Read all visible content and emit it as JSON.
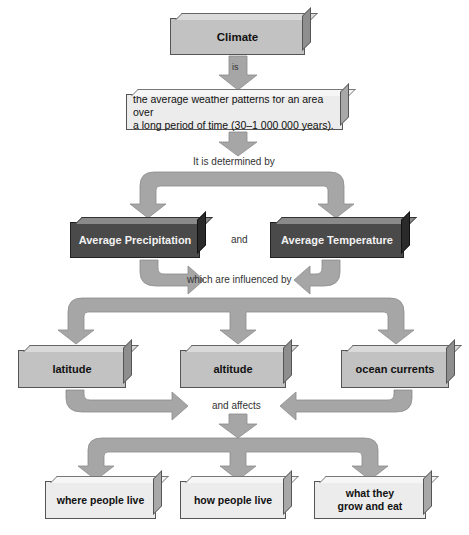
{
  "diagram": {
    "title_node": "Climate",
    "connector_is": "is",
    "definition": {
      "line1": "the average weather patterns for an area over",
      "line2": "a long period of time (30–1 000 000 years)."
    },
    "connector_determined": "It is determined by",
    "determinants": [
      "Average Precipitation",
      "Average Temperature"
    ],
    "connector_and": "and",
    "connector_influenced": "which are influenced by",
    "influences": [
      "latitude",
      "altitude",
      "ocean currents"
    ],
    "connector_affects": "and affects",
    "effects": [
      {
        "line1": "where people live"
      },
      {
        "line1": "how people live"
      },
      {
        "line1": "what they",
        "line2": "grow and eat"
      }
    ]
  },
  "colors": {
    "arrow_fill": "#a6a6a6",
    "arrow_stroke": "#8c8c8c",
    "dark_box": "#4a4a4a",
    "mid_box": "#c2c2c2",
    "light_box": "#ececec"
  }
}
